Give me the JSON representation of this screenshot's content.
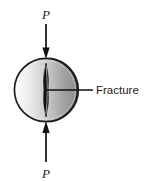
{
  "figure": {
    "type": "mechanics-diagram",
    "title_visible": false,
    "background_color": "#ffffff"
  },
  "specimen": {
    "name": "disk-specimen",
    "shape": "circle",
    "center_x": 46,
    "center_y": 90,
    "radius": 32,
    "edge_color": "#1a1a1a",
    "fill_gradient_from": "#f2f2f2",
    "fill_gradient_to": "#8a8a8a",
    "has_depth_edge": true,
    "depth_edge_side": "right"
  },
  "fracture": {
    "name": "fracture-crack",
    "shape": "vertical-lens",
    "center_x": 46,
    "top_y": 64,
    "bottom_y": 116,
    "max_half_width": 2.6,
    "color": "#111111"
  },
  "loads": [
    {
      "id": "load-top",
      "label": "P",
      "direction": "down",
      "label_x": 46,
      "label_y": 18,
      "shaft_x": 46,
      "shaft_from_y": 24,
      "shaft_to_y": 52,
      "tip_y": 58,
      "color": "#111111"
    },
    {
      "id": "load-bottom",
      "label": "P",
      "direction": "up",
      "label_x": 46,
      "label_y": 174,
      "shaft_x": 46,
      "shaft_from_y": 162,
      "shaft_to_y": 128,
      "tip_y": 122,
      "color": "#111111"
    }
  ],
  "callout": {
    "name": "fracture-callout",
    "label": "Fracture",
    "leader_from_x": 46,
    "leader_from_y": 90,
    "leader_to_x": 93,
    "leader_to_y": 90,
    "text_x": 96,
    "text_y": 94,
    "color": "#111111"
  }
}
